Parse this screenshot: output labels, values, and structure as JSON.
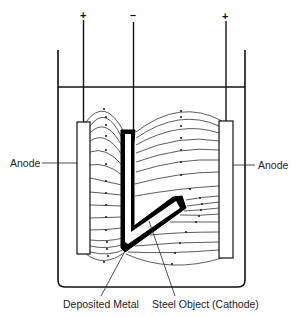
{
  "diagram": {
    "type": "electroplating-cell",
    "terminals": [
      {
        "id": "left-anode-terminal",
        "sign": "+"
      },
      {
        "id": "cathode-terminal",
        "sign": "–"
      },
      {
        "id": "right-anode-terminal",
        "sign": "+"
      }
    ],
    "labels": {
      "anode_left": "Anode",
      "anode_right": "Anode",
      "deposited_metal": "Deposited Metal",
      "cathode": "Steel Object (Cathode)"
    },
    "colors": {
      "line": "#111111",
      "field_line": "#333333",
      "background": "#ffffff",
      "deposit": "#000000"
    }
  }
}
